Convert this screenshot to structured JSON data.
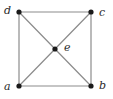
{
  "figure": {
    "kind": "graph-diagram",
    "background_color": "#ffffff",
    "width": 113,
    "height": 99
  },
  "style": {
    "edge_color": "#8c8c8c",
    "edge_width": 1.2,
    "vertex_color": "#1a1a1a",
    "vertex_radius": 2.6,
    "label_color": "#2a2a2a"
  },
  "graph": {
    "vertices": [
      {
        "id": "a",
        "label": "a",
        "x": 19,
        "y": 86,
        "label_x": 4,
        "label_y": 81
      },
      {
        "id": "b",
        "label": "b",
        "x": 91,
        "y": 86,
        "label_x": 99,
        "label_y": 80
      },
      {
        "id": "c",
        "label": "c",
        "x": 91,
        "y": 12,
        "label_x": 99,
        "label_y": 7
      },
      {
        "id": "d",
        "label": "d",
        "x": 19,
        "y": 12,
        "label_x": 4,
        "label_y": 5
      },
      {
        "id": "e",
        "label": "e",
        "x": 55,
        "y": 49,
        "label_x": 64,
        "label_y": 42
      }
    ],
    "edges": [
      {
        "from": "d",
        "to": "c"
      },
      {
        "from": "c",
        "to": "b"
      },
      {
        "from": "b",
        "to": "a"
      },
      {
        "from": "a",
        "to": "d"
      },
      {
        "from": "d",
        "to": "e"
      },
      {
        "from": "c",
        "to": "e"
      },
      {
        "from": "b",
        "to": "e"
      },
      {
        "from": "a",
        "to": "e"
      }
    ]
  }
}
